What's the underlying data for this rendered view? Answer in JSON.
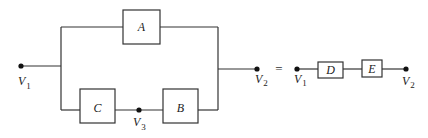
{
  "diagram": {
    "type": "block-diagram-equivalence",
    "left": {
      "blocks": {
        "A": {
          "label": "A"
        },
        "B": {
          "label": "B"
        },
        "C": {
          "label": "C"
        }
      },
      "nodes": {
        "v1": {
          "main": "V",
          "sub": "1"
        },
        "v2": {
          "main": "V",
          "sub": "2"
        },
        "v3": {
          "main": "V",
          "sub": "3"
        }
      },
      "topology": "A in parallel with (C in series with B), between V1 and V2; V3 between C and B"
    },
    "equals_sign": "=",
    "right": {
      "blocks": {
        "D": {
          "label": "D"
        },
        "E": {
          "label": "E"
        }
      },
      "nodes": {
        "v1": {
          "main": "V",
          "sub": "1"
        },
        "v2": {
          "main": "V",
          "sub": "2"
        }
      },
      "topology": "D in series with E between V1 and V2"
    },
    "colors": {
      "line": "#333333",
      "node": "#111111",
      "background": "#ffffff"
    }
  }
}
